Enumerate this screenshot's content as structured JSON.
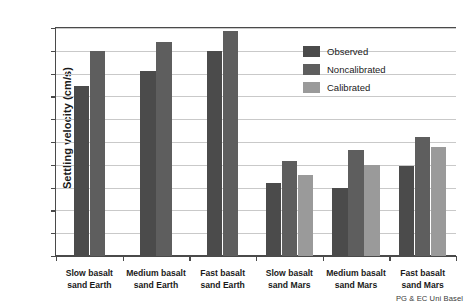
{
  "chart_data": {
    "type": "bar",
    "title": "",
    "xlabel": "",
    "ylabel": "Settling velocity (cm/s)",
    "ylim": [
      0,
      20
    ],
    "ytick_step": 2,
    "yticks": [
      0,
      2,
      4,
      6,
      8,
      10,
      12,
      14,
      16,
      18,
      20
    ],
    "grid": true,
    "legend_position": "inside-top-right",
    "categories": [
      "Slow basalt sand Earth",
      "Medium basalt sand Earth",
      "Fast basalt sand Earth",
      "Slow basalt sand Mars",
      "Medium basalt sand Mars",
      "Fast basalt sand Mars"
    ],
    "series": [
      {
        "name": "Observed",
        "color": "#4b4b4b",
        "values": [
          14.9,
          16.2,
          18.0,
          6.4,
          6.0,
          7.9
        ]
      },
      {
        "name": "Noncalibrated",
        "color": "#5e5e5e",
        "values": [
          18.0,
          18.8,
          19.7,
          8.3,
          9.3,
          10.4
        ]
      },
      {
        "name": "Calibrated",
        "color": "#9a9a9a",
        "values": [
          null,
          null,
          null,
          7.1,
          8.0,
          9.6
        ]
      }
    ]
  },
  "axis": {
    "y_title": "Settling velocity (cm/s)",
    "y_tick_labels": [
      "0",
      "2",
      "4",
      "6",
      "8",
      "10",
      "12",
      "14",
      "16",
      "18",
      "20"
    ],
    "x_tick_labels": [
      [
        "Slow basalt",
        "sand Earth"
      ],
      [
        "Medium basalt",
        "sand Earth"
      ],
      [
        "Fast basalt",
        "sand Earth"
      ],
      [
        "Slow basalt",
        "sand Mars"
      ],
      [
        "Medium basalt",
        "sand Mars"
      ],
      [
        "Fast basalt",
        "sand Mars"
      ]
    ]
  },
  "legend": {
    "items": [
      {
        "label": "Observed",
        "color": "#4b4b4b"
      },
      {
        "label": "Noncalibrated",
        "color": "#5e5e5e"
      },
      {
        "label": "Calibrated",
        "color": "#9a9a9a"
      }
    ]
  },
  "credit": {
    "text": "PG & EC Uni Basel"
  },
  "colors": {
    "axis": "#4a4a4a",
    "grid": "#c9c9c9",
    "text": "#1a1a1a",
    "background": "#ffffff"
  }
}
